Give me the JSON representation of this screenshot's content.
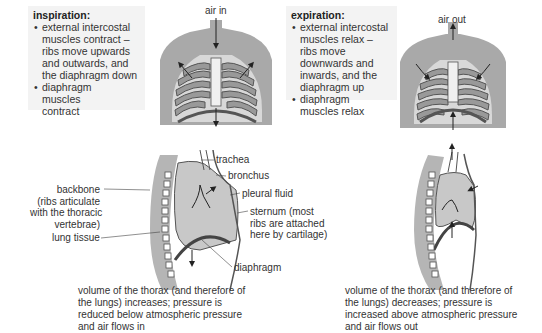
{
  "inspiration": {
    "title": "inspiration:",
    "bullets": [
      "external intercostal muscles contract – ribs move upwards and outwards, and the diaphragm down",
      "diaphragm muscles contract"
    ],
    "air_label": "air in",
    "caption": "volume of the thorax (and therefore of the lungs) increases; pressure is reduced below atmospheric pressure and air flows in"
  },
  "expiration": {
    "title": "expiration:",
    "bullets": [
      "external intercostal muscles relax – ribs move downwards and inwards, and the diaphragm up",
      "diaphragm muscles relax"
    ],
    "air_label": "air out",
    "caption": "volume of the thorax (and therefore of the lungs) decreases; pressure is increased above atmospheric pressure and air flows out"
  },
  "labels": {
    "trachea": "trachea",
    "bronchus": "bronchus",
    "pleural_fluid": "pleural fluid",
    "backbone_1": "backbone",
    "backbone_2": "(ribs articulate",
    "backbone_3": "with the thoracic",
    "backbone_4": "vertebrae)",
    "lung_tissue": "lung tissue",
    "sternum_1": "sternum (most",
    "sternum_2": "ribs are attached",
    "sternum_3": "here by cartilage)",
    "diaphragm": "diaphragm"
  },
  "colors": {
    "body": "#a9a9a9",
    "lung": "#c8c8c8",
    "box_bg": "#f3f3f3",
    "line": "#444444"
  }
}
